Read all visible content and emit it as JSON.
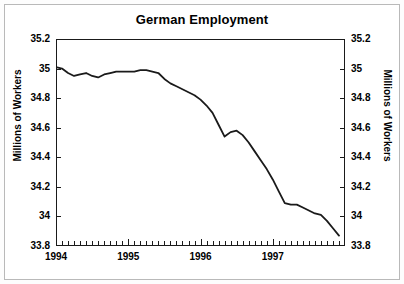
{
  "chart_data": {
    "type": "line",
    "title": "German Employment",
    "xlabel": "",
    "ylabel": "Millions of Workers",
    "ylabel_right": "Millions of Workers",
    "ylim": [
      33.8,
      35.2
    ],
    "xlim": [
      "1994-01",
      "1997-12"
    ],
    "ytick_labels": [
      "35.2",
      "35",
      "34.8",
      "34.6",
      "34.4",
      "34.2",
      "34",
      "33.8"
    ],
    "ytick_values": [
      35.2,
      35.0,
      34.8,
      34.6,
      34.4,
      34.2,
      34.0,
      33.8
    ],
    "xtick_labels": [
      "1994",
      "1995",
      "1996",
      "1997"
    ],
    "xtick_values": [
      1994,
      1995,
      1996,
      1997
    ],
    "minor_x_ticks_per_year": 12,
    "grid": false,
    "legend": null,
    "line_color": "#1a1a1a",
    "line_width": 1.8,
    "series": [
      {
        "name": "German Employment",
        "x": [
          "1994-01",
          "1994-02",
          "1994-03",
          "1994-04",
          "1994-05",
          "1994-06",
          "1994-07",
          "1994-08",
          "1994-09",
          "1994-10",
          "1994-11",
          "1994-12",
          "1995-01",
          "1995-02",
          "1995-03",
          "1995-04",
          "1995-05",
          "1995-06",
          "1995-07",
          "1995-08",
          "1995-09",
          "1995-10",
          "1995-11",
          "1995-12",
          "1996-01",
          "1996-02",
          "1996-03",
          "1996-04",
          "1996-05",
          "1996-06",
          "1996-07",
          "1996-08",
          "1996-09",
          "1996-10",
          "1996-11",
          "1996-12",
          "1997-01",
          "1997-02",
          "1997-03",
          "1997-04",
          "1997-05",
          "1997-06",
          "1997-07",
          "1997-08",
          "1997-09",
          "1997-10",
          "1997-11",
          "1997-12"
        ],
        "values": [
          35.01,
          35.0,
          34.97,
          34.95,
          34.96,
          34.97,
          34.95,
          34.94,
          34.96,
          34.97,
          34.98,
          34.98,
          34.98,
          34.98,
          34.99,
          34.99,
          34.98,
          34.97,
          34.93,
          34.9,
          34.88,
          34.86,
          34.84,
          34.82,
          34.79,
          34.75,
          34.7,
          34.62,
          34.54,
          34.57,
          34.58,
          34.55,
          34.5,
          34.44,
          34.38,
          34.32,
          34.25,
          34.17,
          34.09,
          34.08,
          34.08,
          34.06,
          34.04,
          34.02,
          34.01,
          33.97,
          33.92,
          33.87
        ]
      }
    ]
  }
}
